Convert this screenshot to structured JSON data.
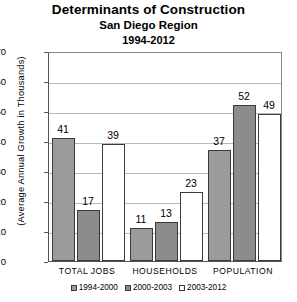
{
  "chart_data": {
    "type": "bar",
    "title": "Determinants of Construction",
    "subtitle": "San Diego Region",
    "period": "1994-2012",
    "xlabel": "",
    "ylabel": "(Average Annual Growth in Thousands)",
    "ylim": [
      0,
      70
    ],
    "ytick_labels": [
      "70",
      "60",
      "50",
      "40",
      "30",
      "20",
      "10",
      "0"
    ],
    "ytick_values": [
      70,
      60,
      50,
      40,
      30,
      20,
      10,
      0
    ],
    "grid": "horizontal",
    "legend_position": "bottom",
    "categories": [
      "TOTAL JOBS",
      "HOUSEHOLDS",
      "POPULATION"
    ],
    "series": [
      {
        "name": "1994-2000",
        "fill": "solid-gray",
        "color": "#9b9b9b",
        "values": [
          41,
          11,
          37
        ]
      },
      {
        "name": "2000-2003",
        "fill": "crosshatch",
        "color": "#8c8c8c",
        "values": [
          17,
          13,
          52
        ]
      },
      {
        "name": "2003-2012",
        "fill": "white",
        "color": "#ffffff",
        "values": [
          39,
          23,
          49
        ]
      }
    ],
    "axis_color": "#555555",
    "gridline_color": "#b9b9b9",
    "bar_border_color": "#3a3a3a"
  }
}
